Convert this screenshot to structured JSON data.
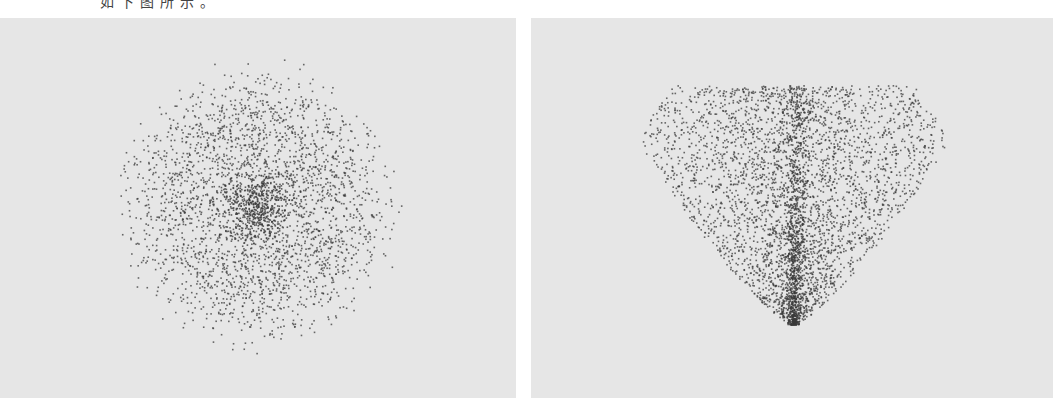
{
  "caption": "如下图所示。",
  "chart_data": [
    {
      "type": "scatter",
      "title": "",
      "xlabel": "",
      "ylabel": "",
      "grid": false,
      "legend": null,
      "description": "Isotropic radial point cloud, dense core, sparse halo",
      "panel": {
        "x": 0,
        "y": 18,
        "width": 516,
        "height": 380,
        "background": "#e6e6e6"
      },
      "distribution": {
        "shape": "radial",
        "center": [
          258,
          205
        ],
        "radius": 150,
        "core_radius": 18,
        "n_points": 2600,
        "core_points": 500
      },
      "point_color": "#3a3a3a",
      "point_size": 1.6
    },
    {
      "type": "scatter",
      "title": "",
      "xlabel": "",
      "ylabel": "",
      "grid": false,
      "legend": null,
      "description": "V/heart-shaped point cloud with dense apex at bottom and vertical central spine",
      "panel": {
        "x": 531,
        "y": 18,
        "width": 522,
        "height": 380,
        "background": "#e6e6e6"
      },
      "distribution": {
        "shape": "cone",
        "apex": [
          793,
          324
        ],
        "top_y": 85,
        "half_width_top": 190,
        "spine_x": 797,
        "n_points": 3400,
        "spine_points": 700
      },
      "point_color": "#3a3a3a",
      "point_size": 1.6
    }
  ]
}
